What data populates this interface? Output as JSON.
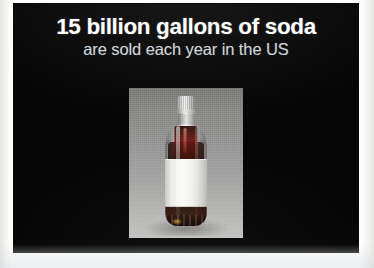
{
  "slide": {
    "headline": "15 billion gallons of soda",
    "subhead": "are sold each year in the US",
    "background_color": "#050505",
    "headline_color": "#ffffff",
    "subhead_color": "#cfd4d9"
  },
  "photo": {
    "subject": "soda-bottle",
    "description": "Clear plastic soda bottle filled with dark cola, blank white wrap label, on a gray gradient studio background",
    "background_top_color": "#7c7c7a",
    "background_bottom_color": "#c3c4c1",
    "liquid_color": "#2a0e0a",
    "label_color": "#fbfbf8",
    "cap_color": "#e6e8e6"
  }
}
